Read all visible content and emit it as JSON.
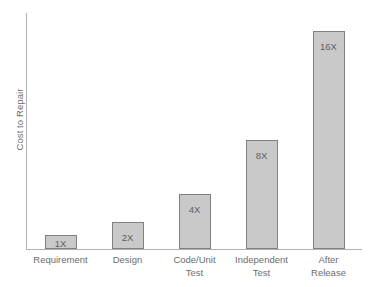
{
  "chart_data": {
    "type": "bar",
    "title": "",
    "xlabel": "",
    "ylabel": "Cost to Repair",
    "categories": [
      "Requirement",
      "Design",
      "Code/Unit Test",
      "Independent Test",
      "After Release"
    ],
    "category_lines": [
      [
        "Requirement"
      ],
      [
        "Design"
      ],
      [
        "Code/Unit",
        "Test"
      ],
      [
        "Independent",
        "Test"
      ],
      [
        "After",
        "Release"
      ]
    ],
    "values": [
      1,
      2,
      4,
      8,
      16
    ],
    "value_labels": [
      "1X",
      "2X",
      "4X",
      "8X",
      "16X"
    ],
    "ylim": [
      0,
      17.3
    ],
    "grid": false,
    "legend": null,
    "axis_ticks_y": [],
    "colors": {
      "bar_fill": "#c9c9c9",
      "bar_border": "#808080",
      "axis_line": "#b0b0b0",
      "text": "#6d6d6d",
      "value_text": "#5f5f5f",
      "background": "#ffffff"
    }
  }
}
